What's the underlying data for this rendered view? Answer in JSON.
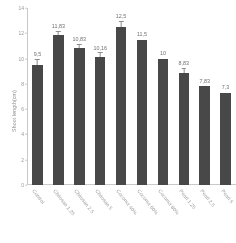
{
  "chart_data": {
    "type": "bar",
    "title": "",
    "xlabel": "",
    "ylabel": "Shoot length(cm)",
    "ylim": [
      0,
      14
    ],
    "yticks": [
      "14",
      "12",
      "10",
      "8",
      "6",
      "4",
      "2",
      "0"
    ],
    "grid": false,
    "legend": "none",
    "bar_color": "#434343",
    "categories": [
      "Control",
      "Chitosan 1.25",
      "Chitosan 2.5",
      "Chitosan 5",
      "Coconut 40%",
      "Coconut 60%",
      "Coconut 80%",
      "Pearl 1.25",
      "Pearl 2.5",
      "Pearl 5"
    ],
    "values": [
      9.5,
      11.83,
      10.83,
      10.16,
      12.5,
      11.5,
      10,
      8.83,
      7.83,
      7.3
    ],
    "value_labels": [
      "9,5",
      "11,83",
      "10,83",
      "10,16",
      "12,5",
      "11,5",
      "10",
      "8,83",
      "7,83",
      "7,3"
    ],
    "errors": [
      0.45,
      0.3,
      0.3,
      0.28,
      0.4,
      0.0,
      0.0,
      0.35,
      0.0,
      0.0
    ]
  }
}
